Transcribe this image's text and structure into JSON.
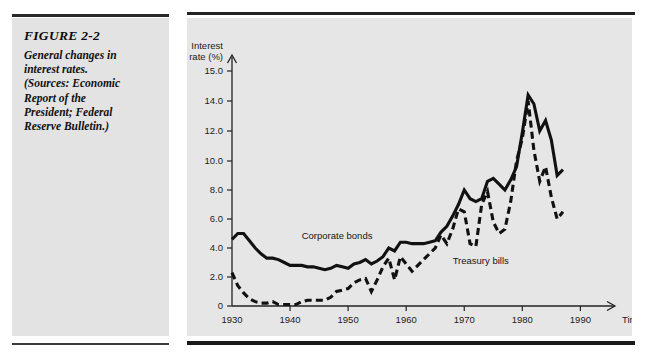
{
  "figure": {
    "title": "FIGURE 2-2",
    "caption_lines": [
      "General changes in",
      "interest rates.",
      "(Sources: Economic",
      "Report of the",
      "President; Federal",
      "Reserve Bulletin.)"
    ]
  },
  "colors": {
    "panel_background": "#e6e6e6",
    "caption_background": "#e3e3e3",
    "ink": "#111111",
    "page_background": "#ffffff"
  },
  "chart_data": {
    "type": "line",
    "title": "General changes in interest rates",
    "xlabel": "Time",
    "ylabel": "Interest rate (%)",
    "ylabel_lines": [
      "Interest",
      "rate (%)"
    ],
    "x_tick_labels": [
      "1930",
      "1940",
      "1950",
      "1960",
      "1970",
      "1980",
      "1990"
    ],
    "x_tick_values": [
      1930,
      1940,
      1950,
      1960,
      1970,
      1980,
      1990
    ],
    "y_tick_labels": [
      "0",
      "2.0",
      "4.0",
      "6.0",
      "8.0",
      "10.0",
      "12.0",
      "14.0",
      "15.0"
    ],
    "y_tick_values": [
      0,
      2,
      4,
      6,
      8,
      10,
      12,
      14,
      15
    ],
    "xlim": [
      1930,
      1992
    ],
    "ylim": [
      0,
      15
    ],
    "grid": false,
    "legend_position": "inline-annotations",
    "annotations": [
      {
        "text": "Corporate bonds",
        "x": 1942,
        "y": 4.6
      },
      {
        "text": "Treasury bills",
        "x": 1968,
        "y": 2.9
      }
    ],
    "series": [
      {
        "name": "Corporate bonds",
        "style": "solid",
        "x": [
          1930,
          1931,
          1932,
          1933,
          1934,
          1935,
          1936,
          1937,
          1938,
          1939,
          1940,
          1941,
          1942,
          1943,
          1944,
          1945,
          1946,
          1947,
          1948,
          1949,
          1950,
          1951,
          1952,
          1953,
          1954,
          1955,
          1956,
          1957,
          1958,
          1959,
          1960,
          1961,
          1962,
          1963,
          1964,
          1965,
          1966,
          1967,
          1968,
          1969,
          1970,
          1971,
          1972,
          1973,
          1974,
          1975,
          1976,
          1977,
          1978,
          1979,
          1980,
          1981,
          1982,
          1983,
          1984,
          1985,
          1986,
          1987
        ],
        "values": [
          4.6,
          5.0,
          5.0,
          4.5,
          4.0,
          3.6,
          3.3,
          3.3,
          3.2,
          3.0,
          2.8,
          2.8,
          2.8,
          2.7,
          2.7,
          2.6,
          2.5,
          2.6,
          2.8,
          2.7,
          2.6,
          2.9,
          3.0,
          3.2,
          2.9,
          3.1,
          3.4,
          4.0,
          3.8,
          4.4,
          4.4,
          4.3,
          4.3,
          4.3,
          4.4,
          4.5,
          5.1,
          5.5,
          6.2,
          7.0,
          8.0,
          7.4,
          7.2,
          7.4,
          8.6,
          8.8,
          8.4,
          8.0,
          8.7,
          9.6,
          11.9,
          14.2,
          13.8,
          12.0,
          12.7,
          11.4,
          9.0,
          9.4
        ],
        "unit": "%"
      },
      {
        "name": "Treasury bills",
        "style": "dashed",
        "x": [
          1930,
          1931,
          1932,
          1933,
          1934,
          1935,
          1936,
          1937,
          1938,
          1939,
          1940,
          1941,
          1942,
          1943,
          1944,
          1945,
          1946,
          1947,
          1948,
          1949,
          1950,
          1951,
          1952,
          1953,
          1954,
          1955,
          1956,
          1957,
          1958,
          1959,
          1960,
          1961,
          1962,
          1963,
          1964,
          1965,
          1966,
          1967,
          1968,
          1969,
          1970,
          1971,
          1972,
          1973,
          1974,
          1975,
          1976,
          1977,
          1978,
          1979,
          1980,
          1981,
          1982,
          1983,
          1984,
          1985,
          1986,
          1987
        ],
        "values": [
          2.3,
          1.4,
          0.9,
          0.5,
          0.3,
          0.2,
          0.2,
          0.3,
          0.1,
          0.1,
          0.1,
          0.1,
          0.3,
          0.4,
          0.4,
          0.4,
          0.4,
          0.6,
          1.0,
          1.1,
          1.2,
          1.6,
          1.8,
          1.9,
          1.0,
          1.8,
          2.7,
          3.3,
          1.8,
          3.4,
          2.9,
          2.4,
          2.8,
          3.2,
          3.6,
          4.0,
          4.9,
          4.3,
          5.3,
          6.7,
          6.5,
          4.3,
          4.1,
          7.0,
          7.9,
          5.8,
          5.0,
          5.3,
          7.2,
          10.0,
          11.5,
          14.0,
          10.7,
          8.6,
          9.6,
          7.5,
          6.0,
          6.5
        ],
        "unit": "%"
      }
    ]
  }
}
